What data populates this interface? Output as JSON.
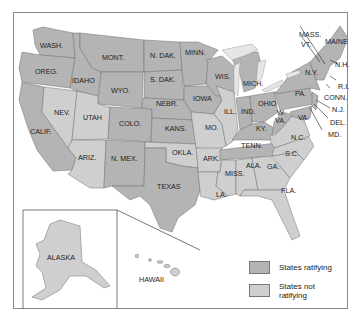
{
  "map": {
    "colors": {
      "ratifying": "#b4b4b4",
      "not_ratifying": "#cfcfcf",
      "water": "#ffffff",
      "border": "#6e6e6e"
    },
    "states": {
      "wash": "WASH.",
      "oreg": "OREG.",
      "calif": "CALIF.",
      "idaho": "IDAHO",
      "nev": "NEV.",
      "mont": "MONT.",
      "wyo": "WYO.",
      "utah": "UTAH",
      "colo": "COLO.",
      "ariz": "ARIZ.",
      "nmex": "N. MEX.",
      "ndak": "N. DAK.",
      "sdak": "S. DAK.",
      "nebr": "NEBR.",
      "kans": "KANS.",
      "okla": "OKLA.",
      "texas": "TEXAS",
      "minn": "MINN.",
      "iowa": "IOWA",
      "mo": "MO.",
      "ark": "ARK.",
      "la": "LA.",
      "wis": "WIS.",
      "ill": "ILL.",
      "mich": "MICH.",
      "ind": "IND.",
      "ohio": "OHIO",
      "ky": "KY.",
      "tenn": "TENN.",
      "miss": "MISS.",
      "ala": "ALA.",
      "ga": "GA.",
      "fla": "FLA.",
      "sc": "S.C.",
      "nc": "N.C.",
      "va": "VA.",
      "wva": "W.\nVA.",
      "pa": "PA.",
      "ny": "N.Y.",
      "vt": "VT.",
      "nh": "N.H.",
      "maine": "MAINE",
      "mass": "MASS.",
      "ri": "R.I.",
      "conn": "CONN.",
      "nj": "N.J.",
      "del": "DEL.",
      "md": "MD.",
      "alaska": "ALASKA",
      "hawaii": "HAWAII"
    }
  },
  "legend": {
    "ratifying": "States ratifying",
    "not_ratifying_1": "States not",
    "not_ratifying_2": "ratifying"
  }
}
